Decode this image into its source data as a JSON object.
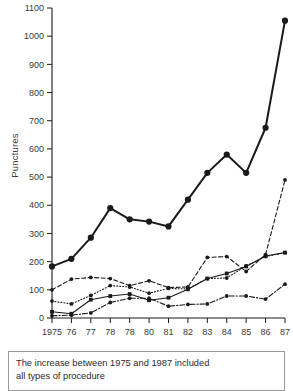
{
  "chart_data": {
    "type": "line",
    "title": "",
    "xlabel": "",
    "ylabel": "Punctures",
    "ylim": [
      0,
      1100
    ],
    "ytick_step": 100,
    "yticks": [
      0,
      100,
      200,
      300,
      400,
      500,
      600,
      700,
      800,
      900,
      1000,
      1100
    ],
    "categories": [
      "1975",
      "76",
      "77",
      "78",
      "78",
      "80",
      "81",
      "82",
      "83",
      "84",
      "85",
      "86",
      "87"
    ],
    "grid": false,
    "legend": "none",
    "series": [
      {
        "name": "total-all-procedures",
        "style": "solid-thick",
        "marker": "filled-circle-large",
        "values": [
          183,
          210,
          285,
          390,
          350,
          342,
          325,
          420,
          515,
          580,
          515,
          675,
          1055
        ]
      },
      {
        "name": "series-dashed",
        "style": "dashed",
        "marker": "filled-circle-small",
        "values": [
          100,
          138,
          144,
          140,
          115,
          132,
          108,
          110,
          215,
          218,
          165,
          225,
          490
        ]
      },
      {
        "name": "series-dotted",
        "style": "dotted",
        "marker": "filled-circle-small",
        "values": [
          60,
          50,
          80,
          115,
          110,
          88,
          105,
          103,
          140,
          142,
          185,
          218,
          232
        ]
      },
      {
        "name": "series-solid-thin",
        "style": "solid-thin",
        "marker": "filled-square-small",
        "values": [
          22,
          15,
          65,
          78,
          85,
          63,
          72,
          102,
          140,
          158,
          183,
          220,
          232
        ]
      },
      {
        "name": "series-dash-dot",
        "style": "dash-dot",
        "marker": "filled-circle-small",
        "values": [
          8,
          10,
          18,
          55,
          70,
          70,
          42,
          48,
          50,
          78,
          78,
          67,
          120
        ]
      }
    ]
  },
  "caption": {
    "line1": "The increase between 1975 and 1987 included",
    "line2": "all types of procedure"
  },
  "colors": {
    "ink": "#1a1a1a",
    "text": "#2b2b2b",
    "box_border": "#9a9a9a",
    "background": "#ffffff"
  }
}
